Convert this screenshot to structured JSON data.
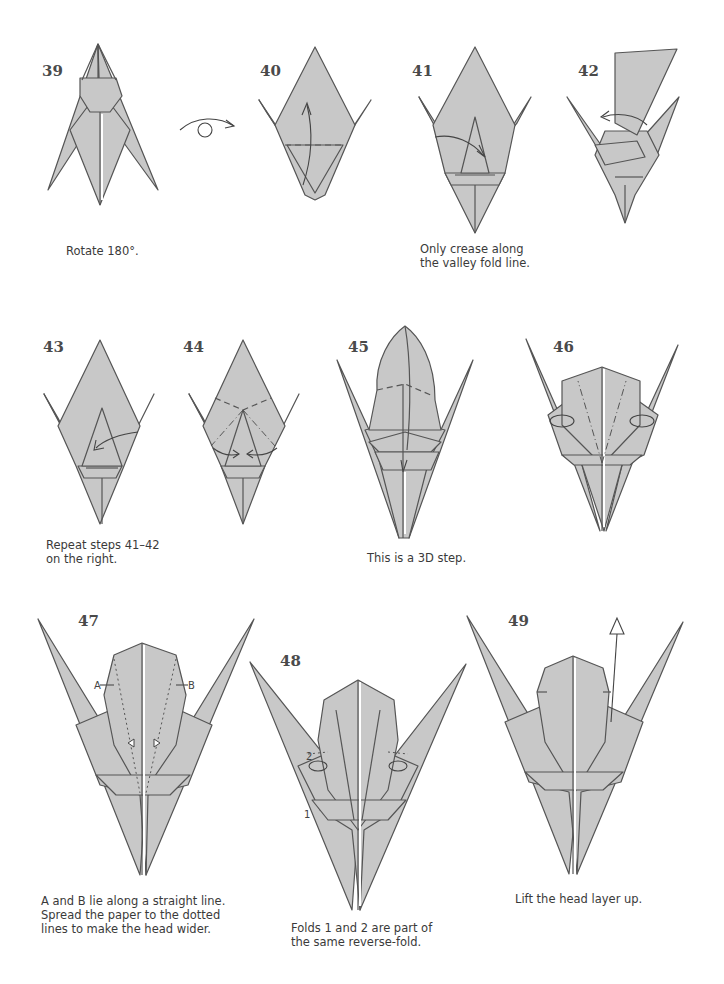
{
  "page": {
    "background": "#ffffff",
    "paper_fill": "#c8c8c8",
    "line_color": "#555555"
  },
  "steps": [
    {
      "number": "39",
      "caption": "Rotate 180°."
    },
    {
      "number": "40",
      "caption": ""
    },
    {
      "number": "41",
      "caption": "Only crease along\nthe valley fold line."
    },
    {
      "number": "42",
      "caption": ""
    },
    {
      "number": "43",
      "caption": "Repeat steps 41–42\non the right."
    },
    {
      "number": "44",
      "caption": ""
    },
    {
      "number": "45",
      "caption": "This is a 3D step."
    },
    {
      "number": "46",
      "caption": ""
    },
    {
      "number": "47",
      "caption": "A and B lie along a straight line.\nSpread the paper to the dotted\nlines to make the head wider.",
      "labels": [
        "A",
        "B"
      ]
    },
    {
      "number": "48",
      "caption": "Folds 1 and 2 are part of\nthe same reverse-fold.",
      "labels": [
        "1",
        "2"
      ]
    },
    {
      "number": "49",
      "caption": "Lift the head layer up."
    }
  ],
  "symbols": {
    "rotate": "rotate-180-symbol"
  }
}
